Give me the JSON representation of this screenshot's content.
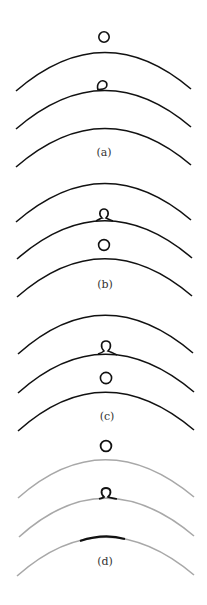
{
  "figure": {
    "colors": {
      "stroke_dark": "#111111",
      "stroke_grey": "#a8a8a8",
      "label": "#333333"
    },
    "panels": [
      {
        "label": "(a)",
        "arc_color": "dark",
        "description": "Free ring above top arc; small loop sitting on middle arc"
      },
      {
        "label": "(b)",
        "arc_color": "dark",
        "description": "Loop tied into middle arc; free ring between middle and bottom arcs"
      },
      {
        "label": "(c)",
        "arc_color": "dark",
        "description": "Loop tied into middle arc; free ring between middle and bottom arcs"
      },
      {
        "label": "(d)",
        "arc_color": "grey",
        "description": "Ring above grey arcs; loop on middle arc; thick dark segment on bottom arc"
      }
    ]
  }
}
